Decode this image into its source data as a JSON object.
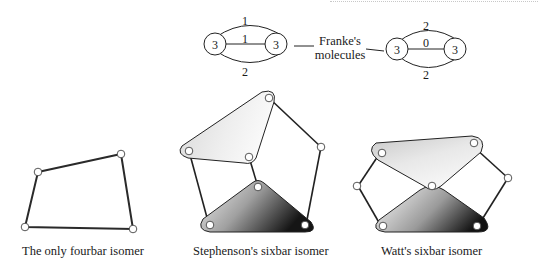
{
  "molecules": {
    "label_line1": "Franke's",
    "label_line2": "molecules",
    "left": {
      "node_left": "3",
      "node_right": "3",
      "edge_top": "1",
      "edge_middle": "1",
      "edge_bottom": "2"
    },
    "right": {
      "node_left": "3",
      "node_right": "3",
      "edge_top": "2",
      "edge_middle": "0",
      "edge_bottom": "2"
    }
  },
  "captions": {
    "fourbar": "The only fourbar isomer",
    "stephenson": "Stephenson's sixbar isomer",
    "watt": "Watt's sixbar isomer"
  },
  "colors": {
    "line": "#222222",
    "link_light": "#f4f4f4",
    "link_dark": "#1c1c1c"
  }
}
